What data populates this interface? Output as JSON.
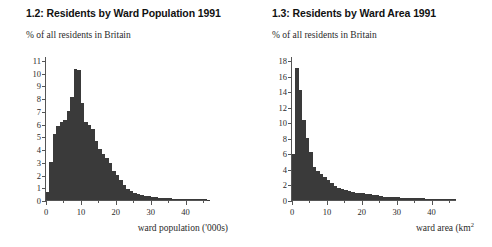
{
  "page": {
    "background": "#ffffff",
    "bar_color": "#3a3a3a",
    "axis_color": "#555555"
  },
  "figures": [
    {
      "id": "fig-1-2",
      "title": "1.2: Residents by Ward Population 1991",
      "subtitle": "% of all residents in Britain",
      "xcaption_text": "ward population ('000s)",
      "xcaption_sup": "",
      "chart_data": {
        "type": "bar",
        "title": "1.2: Residents by Ward Population 1991",
        "subtitle": "% of all residents in Britain",
        "xlabel": "ward population ('000s)",
        "ylabel": "% of all residents in Britain",
        "xlim": [
          0,
          47
        ],
        "ylim": [
          0,
          11
        ],
        "ytick_labels": [
          "0",
          "1",
          "2",
          "3",
          "4",
          "5",
          "6",
          "7",
          "8",
          "9",
          "10",
          "11"
        ],
        "ytick_values": [
          0,
          1,
          2,
          3,
          4,
          5,
          6,
          7,
          8,
          9,
          10,
          11
        ],
        "xtick_labels": [
          "0",
          "10",
          "20",
          "30",
          "40"
        ],
        "xtick_values": [
          0,
          10,
          20,
          30,
          40
        ],
        "xtick_minor_values": [
          5,
          15,
          25,
          35,
          45
        ],
        "grid": false,
        "legend": "none",
        "bin_width": 1,
        "x": [
          0,
          1,
          2,
          3,
          4,
          5,
          6,
          7,
          8,
          9,
          10,
          11,
          12,
          13,
          14,
          15,
          16,
          17,
          18,
          19,
          20,
          21,
          22,
          23,
          24,
          25,
          26,
          27,
          28,
          29,
          30,
          31,
          32,
          33,
          34,
          35,
          36,
          37,
          38,
          39,
          40,
          41,
          42,
          43,
          44,
          45,
          46
        ],
        "values": [
          0.6,
          3.0,
          5.2,
          5.8,
          6.1,
          6.3,
          7.0,
          8.1,
          10.3,
          10.2,
          7.6,
          6.1,
          5.9,
          5.6,
          4.6,
          4.0,
          3.6,
          3.3,
          2.9,
          2.3,
          2.0,
          1.6,
          1.2,
          0.9,
          0.7,
          0.55,
          0.45,
          0.4,
          0.32,
          0.28,
          0.24,
          0.2,
          0.18,
          0.16,
          0.14,
          0.12,
          0.11,
          0.1,
          0.09,
          0.08,
          0.08,
          0.07,
          0.06,
          0.06,
          0.05,
          0.05,
          0.04
        ]
      }
    },
    {
      "id": "fig-1-3",
      "title": "1.3: Residents by Ward Area 1991",
      "subtitle": "% of all residents in Britain",
      "xcaption_text": "ward area (km",
      "xcaption_sup": "2",
      "chart_data": {
        "type": "bar",
        "title": "1.3: Residents by Ward Area 1991",
        "subtitle": "% of all residents in Britain",
        "xlabel": "ward area (km2)",
        "ylabel": "% of all residents in Britain",
        "xlim": [
          0,
          47
        ],
        "ylim": [
          0,
          18
        ],
        "ytick_labels": [
          "0",
          "2",
          "4",
          "6",
          "8",
          "10",
          "12",
          "14",
          "16",
          "18"
        ],
        "ytick_values": [
          0,
          2,
          4,
          6,
          8,
          10,
          12,
          14,
          16,
          18
        ],
        "xtick_labels": [
          "0",
          "10",
          "20",
          "30",
          "40"
        ],
        "xtick_values": [
          0,
          10,
          20,
          30,
          40
        ],
        "xtick_minor_values": [
          5,
          15,
          25,
          35,
          45
        ],
        "grid": false,
        "legend": "none",
        "bin_width": 1,
        "x": [
          0,
          1,
          2,
          3,
          4,
          5,
          6,
          7,
          8,
          9,
          10,
          11,
          12,
          13,
          14,
          15,
          16,
          17,
          18,
          19,
          20,
          21,
          22,
          23,
          24,
          25,
          26,
          27,
          28,
          29,
          30,
          31,
          32,
          33,
          34,
          35,
          36,
          37,
          38,
          39,
          40,
          41,
          42,
          43,
          44,
          45,
          46
        ],
        "values": [
          5.9,
          17.0,
          14.2,
          10.3,
          8.0,
          6.2,
          4.3,
          3.7,
          3.3,
          2.9,
          2.6,
          2.2,
          1.8,
          1.6,
          1.4,
          1.25,
          1.1,
          1.0,
          0.95,
          0.9,
          0.85,
          0.8,
          0.75,
          0.7,
          0.6,
          0.5,
          0.45,
          0.4,
          0.38,
          0.35,
          0.33,
          0.3,
          0.28,
          0.26,
          0.25,
          0.23,
          0.22,
          0.2,
          0.19,
          0.18,
          0.17,
          0.16,
          0.15,
          0.14,
          0.13,
          0.12,
          0.1
        ]
      }
    }
  ]
}
